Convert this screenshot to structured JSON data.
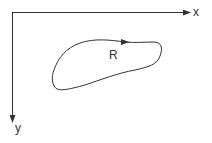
{
  "diagram": {
    "axes": {
      "x_label": "x",
      "y_label": "y"
    },
    "region": {
      "label": "R",
      "orientation": "counterclockwise-arrow-on-top"
    },
    "colors": {
      "stroke": "#333333",
      "background": "#ffffff"
    }
  }
}
